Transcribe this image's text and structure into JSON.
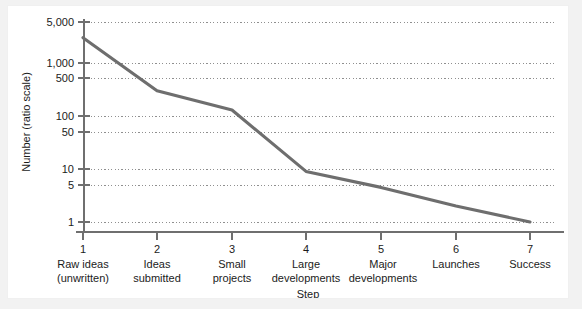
{
  "chart_data": {
    "type": "line",
    "title": "",
    "xlabel": "Step",
    "ylabel": "Number (ratio scale)",
    "yscale": "log",
    "ylim": [
      1,
      6000
    ],
    "grid": true,
    "legend": false,
    "x": [
      1,
      2,
      3,
      4,
      5,
      6,
      7
    ],
    "categories": [
      "Raw ideas\n(unwritten)",
      "Ideas\nsubmitted",
      "Small\nprojects",
      "Large\ndevelopments",
      "Major\ndevelopments",
      "Launches",
      "Success"
    ],
    "values": [
      3000,
      300,
      130,
      9,
      4.5,
      2,
      1
    ],
    "ytick_values": [
      5000,
      1000,
      500,
      100,
      50,
      10,
      5,
      1
    ],
    "ytick_labels": [
      "5,000",
      "1,000",
      "500",
      "100",
      "50",
      "10",
      "5",
      "1"
    ],
    "xtick_labels": [
      "1",
      "2",
      "3",
      "4",
      "5",
      "6",
      "7"
    ],
    "series": [
      {
        "name": "Number",
        "values": [
          3000,
          300,
          130,
          9,
          4.5,
          2,
          1
        ]
      }
    ],
    "colors": {
      "line": "#6e6e6e",
      "grid": "#9a9a9a",
      "axis": "#707070",
      "text": "#1b1b1b",
      "plot_background": "#ffffff",
      "figure_background": "#f2f2f2"
    }
  },
  "axes": {
    "y_title": "Number (ratio scale)",
    "x_title": "Step"
  },
  "category_labels": [
    {
      "line1": "Raw ideas",
      "line2": "(unwritten)"
    },
    {
      "line1": "Ideas",
      "line2": "submitted"
    },
    {
      "line1": "Small",
      "line2": "projects"
    },
    {
      "line1": "Large",
      "line2": "developments"
    },
    {
      "line1": "Major",
      "line2": "developments"
    },
    {
      "line1": "Launches",
      "line2": ""
    },
    {
      "line1": "Success",
      "line2": ""
    }
  ],
  "ytick_labels": {
    "t0": "5,000",
    "t1": "1,000",
    "t2": "500",
    "t3": "100",
    "t4": "50",
    "t5": "10",
    "t6": "5",
    "t7": "1"
  },
  "xtick_labels": {
    "t0": "1",
    "t1": "2",
    "t2": "3",
    "t3": "4",
    "t4": "5",
    "t5": "6",
    "t6": "7"
  }
}
